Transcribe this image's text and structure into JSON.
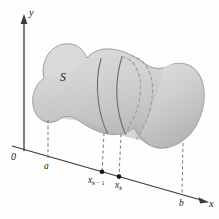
{
  "figure": {
    "caption": "",
    "background_color": "#fefefe"
  },
  "axes": {
    "y_axis": {
      "label": "y",
      "arrow": "up",
      "color": "#3a3a3a"
    },
    "x_axis": {
      "label": "x",
      "arrow": "right",
      "color": "#3a3a3a"
    },
    "origin": {
      "label": "0"
    }
  },
  "solid": {
    "label": "S",
    "fill_color": "#d2d2d2",
    "fill_color_dark": "#b9b9b9",
    "fill_color_light": "#dedede",
    "outline_color": "#8c8c8c"
  },
  "tick_labels": [
    {
      "name": "a",
      "label": "a"
    },
    {
      "name": "x-k-minus-1",
      "label": "x",
      "subscript": "k",
      "subscript_op": " − 1"
    },
    {
      "name": "x-k",
      "label": "x",
      "subscript": "k",
      "subscript_op": ""
    },
    {
      "name": "b",
      "label": "b"
    }
  ],
  "markers": {
    "point_color": "#1a1a1a",
    "dashed_color": "#6a6a6a",
    "slice_curve_color": "#6e6e6e",
    "hidden_curve_color": "#9a9a9a"
  },
  "colors": {
    "ink": "#1a1a1a",
    "axis": "#3a3a3a",
    "dash": "#6a6a6a"
  }
}
